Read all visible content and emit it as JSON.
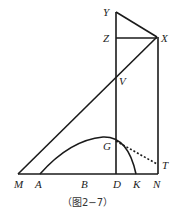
{
  "figure": {
    "caption": "（图2−7）",
    "labels": {
      "Y": "Y",
      "Z": "Z",
      "X": "X",
      "V": "V",
      "G": "G",
      "T": "T",
      "M": "M",
      "A": "A",
      "B": "B",
      "D": "D",
      "K": "K",
      "N": "N"
    }
  }
}
